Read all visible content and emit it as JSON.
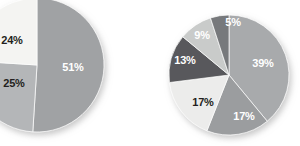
{
  "figure": {
    "background": "#ffffff",
    "width": 300,
    "height": 146
  },
  "chart_data": [
    {
      "id": "left-pie",
      "type": "pie",
      "title": "",
      "legend_position": "none",
      "center": [
        37,
        65
      ],
      "radius": 67,
      "start_angle_deg": 0,
      "direction": "clockwise",
      "categories": [
        "51%",
        "25%",
        "24%"
      ],
      "values": [
        51,
        25,
        24
      ],
      "labels": [
        "51%",
        "25%",
        "24%"
      ],
      "colors": [
        "#a0a2a4",
        "#b4b6b8",
        "#f4f4f2"
      ],
      "label_colors": [
        "#ffffff",
        "#231f20",
        "#231f20"
      ],
      "label_positions": [
        [
          73,
          68
        ],
        [
          14,
          84
        ],
        [
          12,
          41
        ]
      ]
    },
    {
      "id": "right-pie",
      "type": "pie",
      "title": "",
      "legend_position": "none",
      "center": [
        229,
        75
      ],
      "radius": 60,
      "start_angle_deg": 0,
      "direction": "clockwise",
      "categories": [
        "39%",
        "17%",
        "17%",
        "13%",
        "9%",
        "5%"
      ],
      "values": [
        39,
        17,
        17,
        13,
        9,
        5
      ],
      "labels": [
        "39%",
        "17%",
        "17%",
        "13%",
        "9%",
        "5%"
      ],
      "colors": [
        "#a8aaac",
        "#9b9d9f",
        "#ececeb",
        "#58595b",
        "#c9cbca",
        "#77797b"
      ],
      "label_colors": [
        "#ffffff",
        "#ffffff",
        "#231f20",
        "#ffffff",
        "#ffffff",
        "#ffffff"
      ],
      "label_positions": [
        [
          263,
          64
        ],
        [
          244,
          117
        ],
        [
          203,
          103
        ],
        [
          185,
          61
        ],
        [
          202,
          36
        ],
        [
          233,
          23
        ]
      ]
    }
  ]
}
